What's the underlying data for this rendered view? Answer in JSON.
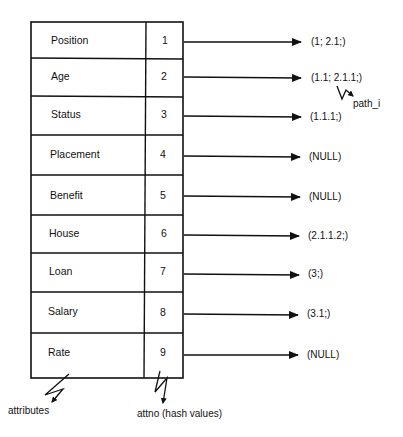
{
  "diagram": {
    "rows": [
      {
        "attribute": "Position",
        "attno": "1",
        "pointer": "(1; 2.1;)"
      },
      {
        "attribute": "Age",
        "attno": "2",
        "pointer": "(1.1; 2.1.1;)"
      },
      {
        "attribute": "Status",
        "attno": "3",
        "pointer": "(1.1.1;)"
      },
      {
        "attribute": "Placement",
        "attno": "4",
        "pointer": "(NULL)"
      },
      {
        "attribute": "Benefit",
        "attno": "5",
        "pointer": "(NULL)"
      },
      {
        "attribute": "House",
        "attno": "6",
        "pointer": "(2.1.1.2;)"
      },
      {
        "attribute": "Loan",
        "attno": "7",
        "pointer": "(3;)"
      },
      {
        "attribute": "Salary",
        "attno": "8",
        "pointer": "(3.1;)"
      },
      {
        "attribute": "Rate",
        "attno": "9",
        "pointer": "(NULL)"
      }
    ],
    "annotations": {
      "path_label": "path_i",
      "attributes_label": "attributes",
      "attno_label": "attno (hash values)"
    },
    "colors": {
      "line": "#111111",
      "background": "#ffffff"
    }
  }
}
